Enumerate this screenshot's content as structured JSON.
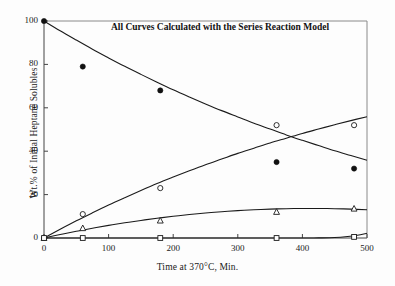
{
  "chart_data": {
    "type": "scatter",
    "title": "All Curves Calculated with the Series Reaction Model",
    "xlabel": "Time at 370°C, Min.",
    "ylabel": "Wt.% of Initial Heptane Solubles",
    "xlim": [
      0,
      500
    ],
    "ylim": [
      0,
      100
    ],
    "xticks": [
      0,
      100,
      200,
      300,
      400,
      500
    ],
    "yticks": [
      0,
      20,
      40,
      60,
      80,
      100
    ],
    "grid": false,
    "legend": "none",
    "series": [
      {
        "name": "Heptane Solubles",
        "marker": "filled-circle",
        "x": [
          0,
          60,
          180,
          360,
          480
        ],
        "values": [
          100,
          79,
          68,
          35,
          32
        ],
        "curve_x": [
          0,
          25,
          50,
          75,
          100,
          125,
          150,
          175,
          200,
          225,
          250,
          275,
          300,
          325,
          350,
          375,
          400,
          425,
          450,
          475,
          500
        ],
        "curve_y": [
          100,
          95.5,
          91.2,
          87.0,
          83.0,
          79.1,
          75.4,
          71.8,
          68.3,
          65.0,
          61.8,
          58.7,
          55.8,
          52.9,
          50.2,
          47.5,
          45.0,
          42.6,
          40.2,
          38.0,
          35.8
        ]
      },
      {
        "name": "Open Circle Product",
        "marker": "open-circle",
        "x": [
          0,
          60,
          180,
          360,
          480
        ],
        "values": [
          0,
          11,
          23,
          52,
          52
        ],
        "curve_x": [
          0,
          25,
          50,
          75,
          100,
          125,
          150,
          175,
          200,
          225,
          250,
          275,
          300,
          325,
          350,
          375,
          400,
          425,
          450,
          475,
          500
        ],
        "curve_y": [
          0,
          4.0,
          7.9,
          11.6,
          15.2,
          18.6,
          21.9,
          25.1,
          28.1,
          31.0,
          33.8,
          36.4,
          39.0,
          41.4,
          43.8,
          46.0,
          48.2,
          50.2,
          52.2,
          54.1,
          55.9
        ]
      },
      {
        "name": "Triangle Product",
        "marker": "open-triangle",
        "x": [
          0,
          60,
          180,
          360,
          480
        ],
        "values": [
          0,
          4.5,
          8,
          12,
          13.5
        ],
        "curve_x": [
          0,
          25,
          50,
          75,
          100,
          125,
          150,
          175,
          200,
          225,
          250,
          275,
          300,
          325,
          350,
          375,
          400,
          425,
          450,
          475,
          500
        ],
        "curve_y": [
          0,
          1.6,
          3.1,
          4.5,
          5.8,
          7.0,
          8.1,
          9.1,
          10.0,
          10.8,
          11.5,
          12.1,
          12.6,
          13.0,
          13.3,
          13.5,
          13.6,
          13.6,
          13.5,
          13.3,
          13.0
        ]
      },
      {
        "name": "Square Product",
        "marker": "open-square",
        "x": [
          0,
          60,
          180,
          360,
          480
        ],
        "values": [
          0,
          0,
          0,
          0,
          0.5
        ],
        "curve_x": [
          0,
          50,
          100,
          150,
          200,
          250,
          300,
          350,
          400,
          425,
          450,
          470,
          485,
          500
        ],
        "curve_y": [
          0,
          0,
          0,
          0,
          0,
          0,
          0,
          0,
          0,
          0.05,
          0.2,
          0.7,
          1.3,
          2.2
        ]
      }
    ]
  },
  "axes": {
    "xtick_labels": [
      "0",
      "100",
      "200",
      "300",
      "400",
      "500"
    ],
    "ytick_labels": [
      "0",
      "20",
      "40",
      "60",
      "80",
      "100"
    ]
  },
  "style": {
    "line_color": "#1a1a1a",
    "marker_fill": "#111111",
    "marker_open": "#ffffff",
    "axis_color": "#444444",
    "background": "#fdfdfd"
  }
}
